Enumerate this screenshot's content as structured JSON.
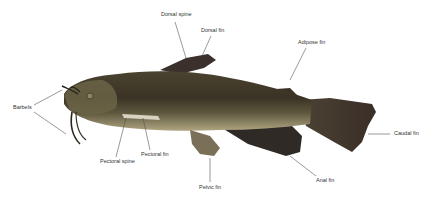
{
  "diagram": {
    "labels": [
      {
        "id": "dorsal-spine",
        "text": "Dorsal spine",
        "x": 161,
        "y": 14
      },
      {
        "id": "dorsal-fin",
        "text": "Dorsal fin",
        "x": 201,
        "y": 29
      },
      {
        "id": "adipose-fin",
        "text": "Adipose fin",
        "x": 298,
        "y": 42
      },
      {
        "id": "barbels",
        "text": "Barbels",
        "x": 13,
        "y": 106
      },
      {
        "id": "pectoral-fin",
        "text": "Pectoral fin",
        "x": 141,
        "y": 153
      },
      {
        "id": "pectoral-spine",
        "text": "Pectoral spine",
        "x": 100,
        "y": 161
      },
      {
        "id": "pelvic-fin",
        "text": "Pelvic fin",
        "x": 199,
        "y": 187
      },
      {
        "id": "anal-fin",
        "text": "Anal fin",
        "x": 316,
        "y": 180
      },
      {
        "id": "caudal-fin",
        "text": "Caudal fin",
        "x": 394,
        "y": 133
      }
    ],
    "colors": {
      "background": "#ffffff",
      "label_text": "#333333",
      "leader_line": "#555555",
      "body_dark": "#3a3325",
      "body_mid": "#5a5236",
      "belly": "#a89c7a",
      "fin_dark": "#3b302b"
    }
  }
}
